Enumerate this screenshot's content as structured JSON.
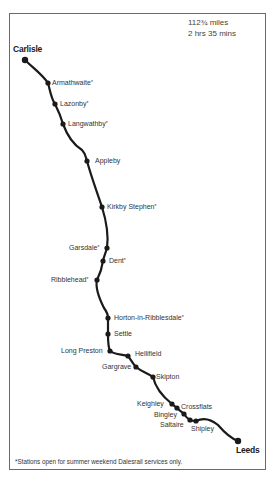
{
  "stats": {
    "distance": "112¾ miles",
    "duration": "2 hrs 35 mins"
  },
  "footnote": "*Stations open for summer weekend Dalesrail services only.",
  "line_color": "#1a1a1a",
  "stations": [
    {
      "name": "Carlisle",
      "terminus": true,
      "dalesrail": false,
      "x": 25,
      "y": 60,
      "lx": 13,
      "ly": 45
    },
    {
      "name": "Armathwaite",
      "terminus": false,
      "dalesrail": true,
      "x": 48,
      "y": 83,
      "lx": 52,
      "ly": 79
    },
    {
      "name": "Lazonby",
      "terminus": false,
      "dalesrail": true,
      "x": 55,
      "y": 104,
      "lx": 60,
      "ly": 100
    },
    {
      "name": "Langwathby",
      "terminus": false,
      "dalesrail": true,
      "x": 63,
      "y": 124,
      "lx": 68,
      "ly": 120
    },
    {
      "name": "Appleby",
      "terminus": false,
      "dalesrail": false,
      "x": 87,
      "y": 161,
      "lx": 95,
      "ly": 157
    },
    {
      "name": "Kirkby Stephen",
      "terminus": false,
      "dalesrail": true,
      "x": 102,
      "y": 207,
      "lx": 107,
      "ly": 203
    },
    {
      "name": "Garsdale",
      "terminus": false,
      "dalesrail": true,
      "x": 107,
      "y": 248,
      "lx": 69,
      "ly": 244
    },
    {
      "name": "Dent",
      "terminus": false,
      "dalesrail": true,
      "x": 103,
      "y": 261,
      "lx": 109,
      "ly": 257
    },
    {
      "name": "Ribblehead",
      "terminus": false,
      "dalesrail": true,
      "x": 97,
      "y": 280,
      "lx": 51,
      "ly": 276
    },
    {
      "name": "Horton-in-Ribblesdale",
      "terminus": false,
      "dalesrail": true,
      "x": 108,
      "y": 318,
      "lx": 114,
      "ly": 314
    },
    {
      "name": "Settle",
      "terminus": false,
      "dalesrail": false,
      "x": 108,
      "y": 334,
      "lx": 114,
      "ly": 330
    },
    {
      "name": "Long Preston",
      "terminus": false,
      "dalesrail": false,
      "x": 110,
      "y": 351,
      "lx": 61,
      "ly": 347
    },
    {
      "name": "Hellifield",
      "terminus": false,
      "dalesrail": false,
      "x": 128,
      "y": 356,
      "lx": 135,
      "ly": 350
    },
    {
      "name": "Gargrave",
      "terminus": false,
      "dalesrail": false,
      "x": 136,
      "y": 367,
      "lx": 102,
      "ly": 363
    },
    {
      "name": "Skipton",
      "terminus": false,
      "dalesrail": false,
      "x": 153,
      "y": 377,
      "lx": 156,
      "ly": 373
    },
    {
      "name": "Keighley",
      "terminus": false,
      "dalesrail": false,
      "x": 172,
      "y": 404,
      "lx": 137,
      "ly": 400
    },
    {
      "name": "Crossflats",
      "terminus": false,
      "dalesrail": false,
      "x": 177,
      "y": 408,
      "lx": 181,
      "ly": 403
    },
    {
      "name": "Bingley",
      "terminus": false,
      "dalesrail": false,
      "x": 184,
      "y": 414,
      "lx": 154,
      "ly": 411
    },
    {
      "name": "Saltaire",
      "terminus": false,
      "dalesrail": false,
      "x": 190,
      "y": 420,
      "lx": 160,
      "ly": 421
    },
    {
      "name": "Shipley",
      "terminus": false,
      "dalesrail": false,
      "x": 196,
      "y": 421,
      "lx": 191,
      "ly": 425
    },
    {
      "name": "Leeds",
      "terminus": true,
      "dalesrail": false,
      "x": 238,
      "y": 441,
      "lx": 236,
      "ly": 446
    }
  ],
  "route_path": "M25,60 C33,68 42,74 48,83 C50,90 51,98 55,104 C58,110 61,117 63,124 C67,135 74,145 82,150 C86,154 86,158 87,161 C91,176 97,192 102,207 C106,220 109,234 107,248 C106,252 104,256 103,261 C102,268 100,274 97,280 C95,288 100,300 104,308 C107,312 108,316 108,318 C108,324 108,330 108,334 C108,340 108,347 110,351 C115,355 122,354 128,356 C131,360 133,364 136,367 C142,372 148,373 153,377 C155,386 162,396 172,404 C174,406 176,407 177,408 C180,411 182,412 184,414 C186,417 188,419 190,420 C192,421 194,421 196,421 C204,417 212,420 218,425 C224,432 230,438 238,441"
}
